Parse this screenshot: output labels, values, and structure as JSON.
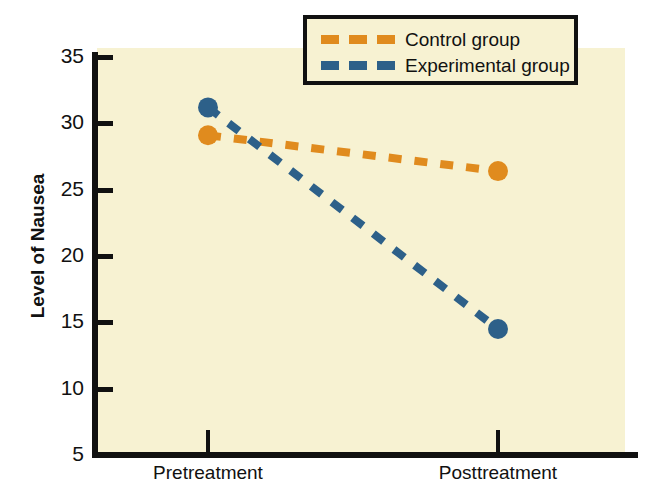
{
  "chart_data": {
    "type": "line",
    "title": "",
    "xlabel": "",
    "ylabel": "Level of Nausea",
    "categories": [
      "Pretreatment",
      "Posttreatment"
    ],
    "ylim": [
      5,
      35
    ],
    "yticks": [
      35,
      30,
      25,
      20,
      15,
      10,
      5
    ],
    "grid": false,
    "legend_position": "top-right",
    "series": [
      {
        "name": "Control group",
        "color": "#e08b1e",
        "linestyle": "dashed",
        "marker": "circle",
        "values": [
          29.1,
          26.4
        ]
      },
      {
        "name": "Experimental group",
        "color": "#2d6089",
        "linestyle": "dashed",
        "marker": "circle",
        "values": [
          31.2,
          14.5
        ]
      }
    ]
  },
  "legend": {
    "entries": [
      {
        "label": "Control group"
      },
      {
        "label": "Experimental group"
      }
    ]
  },
  "colors": {
    "control": "#e08b1e",
    "experimental": "#2d6089",
    "plot_background": "#f7f2d2",
    "axis": "#111111",
    "page_background": "#ffffff"
  }
}
